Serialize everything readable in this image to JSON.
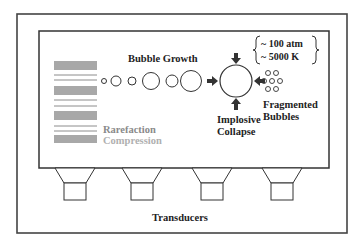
{
  "diagram": {
    "labels": {
      "bubble_growth": "Bubble Growth",
      "pressure": "~ 100 atm",
      "temperature": "~ 5000 K",
      "fragmented_line1": "Fragmented",
      "fragmented_line2": "Bubbles",
      "implosive_line1": "Implosive",
      "implosive_line2": "Collapse",
      "rarefaction": "Rarefaction",
      "compression": "Compression",
      "transducers": "Transducers"
    },
    "legend": [
      {
        "name": "Rarefaction",
        "style": "double-line",
        "color": "#8c8c8c"
      },
      {
        "name": "Compression",
        "style": "solid-band",
        "color": "#a8a8a8"
      }
    ],
    "bubbles": [
      {
        "cx": 104,
        "cy": 81,
        "r": 2.5
      },
      {
        "cx": 116,
        "cy": 81,
        "r": 5
      },
      {
        "cx": 132,
        "cy": 81,
        "r": 4
      },
      {
        "cx": 151,
        "cy": 81,
        "r": 8.5
      },
      {
        "cx": 171,
        "cy": 81,
        "r": 6
      },
      {
        "cx": 190,
        "cy": 81,
        "r": 10.5
      }
    ],
    "collapse_bubble": {
      "cx": 236,
      "cy": 81,
      "r": 16
    },
    "fragments": [
      {
        "cx": 268,
        "cy": 73
      },
      {
        "cx": 276,
        "cy": 73
      },
      {
        "cx": 264,
        "cy": 81
      },
      {
        "cx": 272,
        "cy": 81
      },
      {
        "cx": 280,
        "cy": 81
      },
      {
        "cx": 268,
        "cy": 89
      },
      {
        "cx": 276,
        "cy": 89
      }
    ],
    "transducer_count": 4,
    "colors": {
      "line": "#333333",
      "compression_band": "#a8a8a8",
      "rarefaction_line": "#8c8c8c",
      "legend_text": "#999999"
    }
  }
}
